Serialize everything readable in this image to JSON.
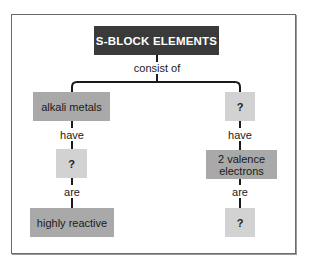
{
  "diagram": {
    "type": "concept-map",
    "root": {
      "label": "S-BLOCK ELEMENTS",
      "link_label": "consist of"
    },
    "branches": [
      {
        "id": "left",
        "nodes": [
          {
            "label": "alkali metals",
            "style": "dark"
          },
          {
            "label": "?",
            "style": "light"
          },
          {
            "label": "highly reactive",
            "style": "dark"
          }
        ],
        "links": [
          "have",
          "are"
        ]
      },
      {
        "id": "right",
        "nodes": [
          {
            "label": "?",
            "style": "light"
          },
          {
            "label": "2 valence electrons",
            "style": "dark"
          },
          {
            "label": "?",
            "style": "light"
          }
        ],
        "links": [
          "have",
          "are"
        ]
      }
    ],
    "colors": {
      "header_bg": "#3a3a3a",
      "header_text": "#ffffff",
      "dark_box": "#a9a9a9",
      "light_box": "#d2d2d2",
      "line": "#1a1a1a",
      "frame": "#6a6a6a"
    }
  }
}
